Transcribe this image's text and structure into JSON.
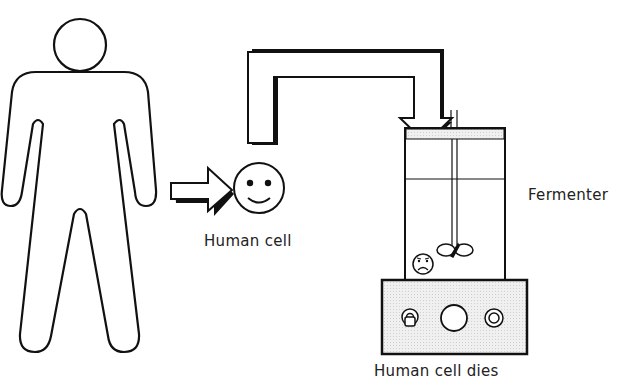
{
  "diagram": {
    "title": "",
    "labels": {
      "human_cell": "Human cell",
      "fermenter": "Fermenter",
      "human_cell_dies": "Human cell dies"
    },
    "nodes": [
      {
        "id": "human-figure",
        "kind": "person outline"
      },
      {
        "id": "human-cell",
        "kind": "smiley face",
        "label": "Human cell"
      },
      {
        "id": "fermenter",
        "kind": "stirred tank vessel with base",
        "label": "Fermenter"
      },
      {
        "id": "dead-cell",
        "kind": "sad face inside fermenter",
        "label": "Human cell dies"
      }
    ],
    "edges": [
      {
        "from": "human-figure",
        "to": "human-cell",
        "kind": "right arrow"
      },
      {
        "from": "human-cell",
        "to": "fermenter",
        "kind": "bent pipe arrow (down into fermenter)"
      }
    ],
    "colors": {
      "stroke": "#111111",
      "fill": "#ffffff",
      "shade": "#e6e6e6",
      "text": "#222222"
    }
  }
}
